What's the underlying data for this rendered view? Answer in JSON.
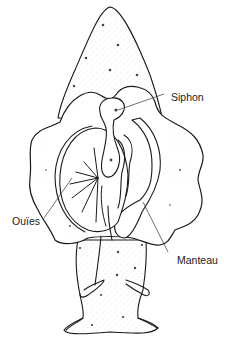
{
  "figure": {
    "colors": {
      "ink": "#1a1a1a",
      "background": "#ffffff",
      "stipple": "#8a8a8a"
    },
    "labels": [
      {
        "id": "siphon",
        "text": "Siphon"
      },
      {
        "id": "ouies",
        "text": "Ouïes"
      },
      {
        "id": "manteau",
        "text": "Manteau"
      }
    ]
  }
}
